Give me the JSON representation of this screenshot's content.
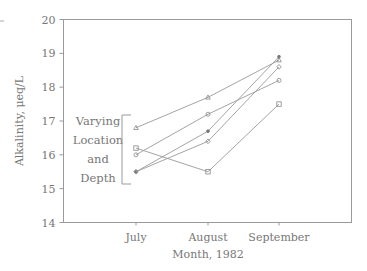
{
  "chart_data": {
    "type": "line",
    "title": "",
    "xlabel": "Month, 1982",
    "ylabel": "Alkalinity, μeq/L",
    "categories": [
      "July",
      "August",
      "September"
    ],
    "ylim": [
      14,
      20
    ],
    "yticks": [
      14,
      15,
      16,
      17,
      18,
      19,
      20
    ],
    "grid": false,
    "legend": null,
    "annotation": {
      "lines": [
        "Varying",
        "Location",
        "and",
        "Depth"
      ],
      "bracket": true
    },
    "series": [
      {
        "name": "Series A",
        "marker": "triangle",
        "values": [
          16.8,
          17.7,
          18.8
        ]
      },
      {
        "name": "Series B",
        "marker": "circle",
        "values": [
          16.0,
          17.2,
          18.2
        ]
      },
      {
        "name": "Series C",
        "marker": "square",
        "values": [
          16.2,
          15.5,
          17.5
        ]
      },
      {
        "name": "Series D",
        "marker": "dot",
        "values": [
          15.5,
          16.7,
          18.9
        ]
      },
      {
        "name": "Series E",
        "marker": "diamond",
        "values": [
          15.5,
          16.4,
          18.6
        ]
      }
    ]
  },
  "axis": {
    "ylabel": "Alkalinity, μeq/L",
    "xlabel": "Month, 1982",
    "yticks": [
      "14",
      "15",
      "16",
      "17",
      "18",
      "19",
      "20"
    ],
    "xticks": [
      "July",
      "August",
      "September"
    ]
  },
  "annotation": {
    "line1": "Varying",
    "line2": "Location",
    "line3": "and",
    "line4": "Depth"
  }
}
